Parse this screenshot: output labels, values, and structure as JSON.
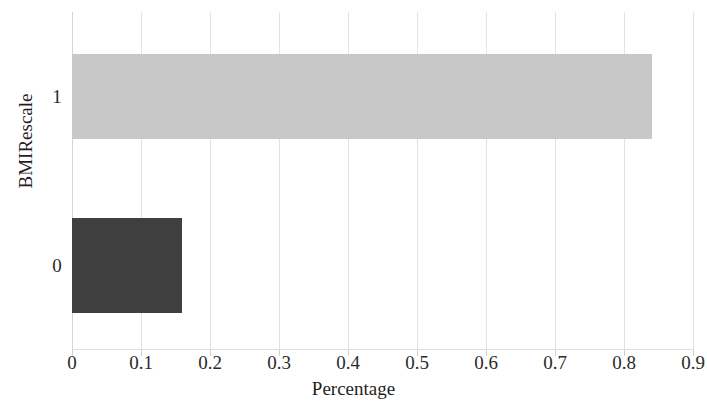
{
  "chart_data": {
    "type": "bar",
    "orientation": "horizontal",
    "title": "",
    "xlabel": "Percentage",
    "ylabel": "BMIRescale",
    "categories": [
      "0",
      "1"
    ],
    "values": [
      0.16,
      0.84
    ],
    "series": [
      {
        "name": "Percentage",
        "values": [
          0.16,
          0.84
        ]
      }
    ],
    "bars": [
      {
        "category": "1",
        "value": 0.84,
        "color": "#c8c8c8"
      },
      {
        "category": "0",
        "value": 0.16,
        "color": "#3f3f3f"
      }
    ],
    "xlim": [
      0,
      0.9
    ],
    "ylim": [
      -0.5,
      1.5
    ],
    "x_ticks": [
      "0",
      "0.1",
      "0.2",
      "0.3",
      "0.4",
      "0.5",
      "0.6",
      "0.7",
      "0.8",
      "0.9"
    ],
    "x_tick_values": [
      0,
      0.1,
      0.2,
      0.3,
      0.4,
      0.5,
      0.6,
      0.7,
      0.8,
      0.9
    ],
    "y_ticks": [
      "1",
      "0"
    ],
    "grid": "vertical",
    "legend": "none",
    "background_color": "#ffffff",
    "gridline_color": "#e3e3e3"
  }
}
